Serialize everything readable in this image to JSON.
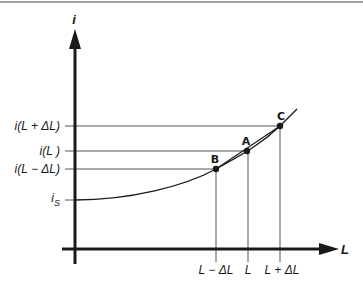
{
  "diagram": {
    "axes": {
      "y_label": "i",
      "x_label": "L"
    },
    "y_ticks": [
      {
        "label": "i(L + ΔL)",
        "y": 126
      },
      {
        "label": "i(L )",
        "y": 151
      },
      {
        "label": "i(L − ΔL)",
        "y": 169
      },
      {
        "label": "i",
        "sub": "S",
        "y": 200
      }
    ],
    "x_ticks": [
      {
        "label": "L − ΔL",
        "x": 216
      },
      {
        "label": "L",
        "x": 248
      },
      {
        "label": "L + ΔL",
        "x": 280
      }
    ],
    "points": [
      {
        "name": "B",
        "x": 216,
        "y": 169
      },
      {
        "name": "A",
        "x": 247,
        "y": 151
      },
      {
        "name": "C",
        "x": 280,
        "y": 126
      }
    ],
    "colors": {
      "ink": "#1a1a1a",
      "guide": "#555555",
      "background": "#ffffff"
    }
  }
}
